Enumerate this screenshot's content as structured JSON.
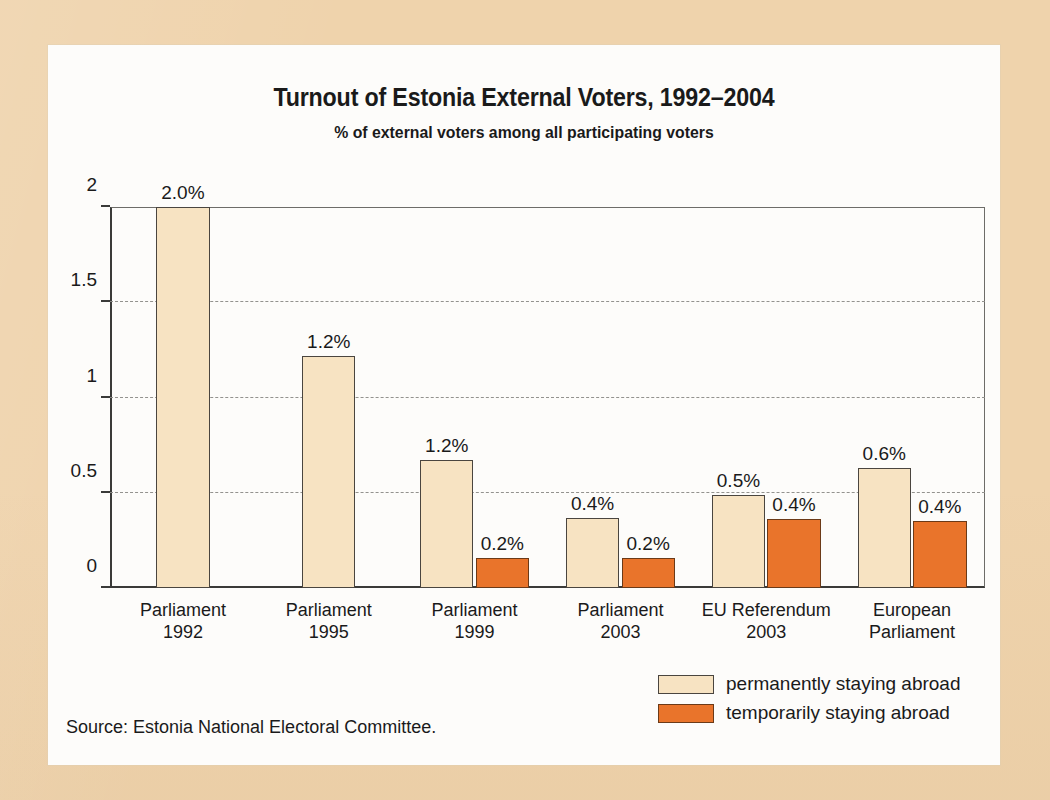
{
  "chart_data": {
    "type": "bar",
    "title": "Turnout of Estonia External Voters, 1992–2004",
    "subtitle": "% of external voters among all participating voters",
    "xlabel": "",
    "ylabel": "",
    "ylim": [
      0,
      2
    ],
    "yticks": [
      "0",
      "0.5",
      "1",
      "1.5",
      "2"
    ],
    "grid": "horizontal dashed at 0.5, 1, 1.5",
    "legend_position": "bottom-right",
    "categories": [
      "Parliament 1992",
      "Parliament 1995",
      "Parliament 1999",
      "Parliament 2003",
      "EU Referendum 2003",
      "European Parliament"
    ],
    "category_lines": [
      [
        "Parliament",
        "1992"
      ],
      [
        "Parliament",
        "1995"
      ],
      [
        "Parliament",
        "1999"
      ],
      [
        "Parliament",
        "2003"
      ],
      [
        "EU Referendum",
        "2003"
      ],
      [
        "European",
        "Parliament"
      ]
    ],
    "series": [
      {
        "name": "permanently staying abroad",
        "color": "#f7e3c2",
        "values": [
          2.0,
          1.22,
          0.67,
          0.37,
          0.49,
          0.63
        ],
        "labels": [
          "2.0%",
          "1.2%",
          "1.2%",
          "0.4%",
          "0.5%",
          "0.6%"
        ]
      },
      {
        "name": "temporarily staying abroad",
        "color": "#e9742b",
        "values": [
          null,
          null,
          0.16,
          0.16,
          0.36,
          0.35
        ],
        "labels": [
          null,
          null,
          "0.2%",
          "0.2%",
          "0.4%",
          "0.4%"
        ]
      }
    ],
    "source": "Source: Estonia National Electoral Committee."
  },
  "colors": {
    "page_background": "#efd3ac",
    "card_background": "#fdfcfa",
    "permanent_bar": "#f7e3c2",
    "temporary_bar": "#e9742b",
    "axis": "#3a3a38",
    "gridline": "#8e8d89",
    "text": "#1a1a1a"
  }
}
